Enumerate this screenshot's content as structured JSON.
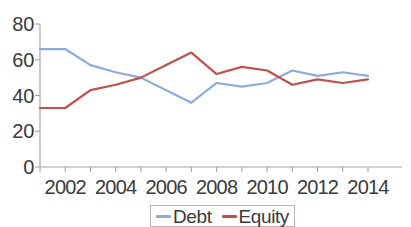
{
  "chart_data": {
    "type": "line",
    "title": "",
    "xlabel": "",
    "ylabel": "",
    "x": [
      2001,
      2002,
      2003,
      2004,
      2005,
      2006,
      2007,
      2008,
      2009,
      2010,
      2011,
      2012,
      2013,
      2014
    ],
    "xlim": [
      2001,
      2014
    ],
    "ylim": [
      0,
      80
    ],
    "grid": false,
    "legend_position": "bottom-center",
    "x_tick_labels": [
      "2002",
      "2004",
      "2006",
      "2008",
      "2010",
      "2012",
      "2014"
    ],
    "x_tick_values": [
      2002,
      2004,
      2006,
      2008,
      2010,
      2012,
      2014
    ],
    "y_tick_labels": [
      "0",
      "20",
      "40",
      "60",
      "80"
    ],
    "y_tick_values": [
      0,
      20,
      40,
      60,
      80
    ],
    "series": [
      {
        "name": "Debt",
        "color": "#8FAADC",
        "values": [
          66,
          66,
          57,
          53,
          50,
          43,
          36,
          47,
          45,
          47,
          54,
          51,
          53,
          51
        ]
      },
      {
        "name": "Equity",
        "color": "#C0504D",
        "values": [
          33,
          33,
          43,
          46,
          50,
          57,
          64,
          52,
          56,
          54,
          46,
          49,
          47,
          49
        ]
      }
    ]
  },
  "axis": {
    "line_color": "#a6a6a6",
    "tick_color": "#a6a6a6"
  },
  "legend": {
    "entries": [
      {
        "label": "Debt",
        "color": "#8FAADC"
      },
      {
        "label": "Equity",
        "color": "#C0504D"
      }
    ]
  }
}
